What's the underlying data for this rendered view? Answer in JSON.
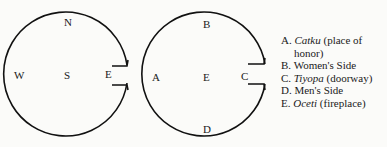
{
  "diagram_left": {
    "labels": {
      "north": "N",
      "west": "W",
      "center": "S",
      "east": "E"
    }
  },
  "diagram_right": {
    "labels": {
      "top": "B",
      "left": "A",
      "center": "E",
      "right": "C",
      "bottom": "D"
    }
  },
  "legend": {
    "items": [
      {
        "key": "A.",
        "term": "Catku",
        "desc": " (place of",
        "desc2": "honor)"
      },
      {
        "key": "B.",
        "term": "",
        "desc": "Women's Side"
      },
      {
        "key": "C.",
        "term": "Tiyopa",
        "desc": " (doorway)"
      },
      {
        "key": "D.",
        "term": "",
        "desc": "Men's Side"
      },
      {
        "key": "E.",
        "term": "Oceti",
        "desc": " (fireplace)"
      }
    ]
  }
}
